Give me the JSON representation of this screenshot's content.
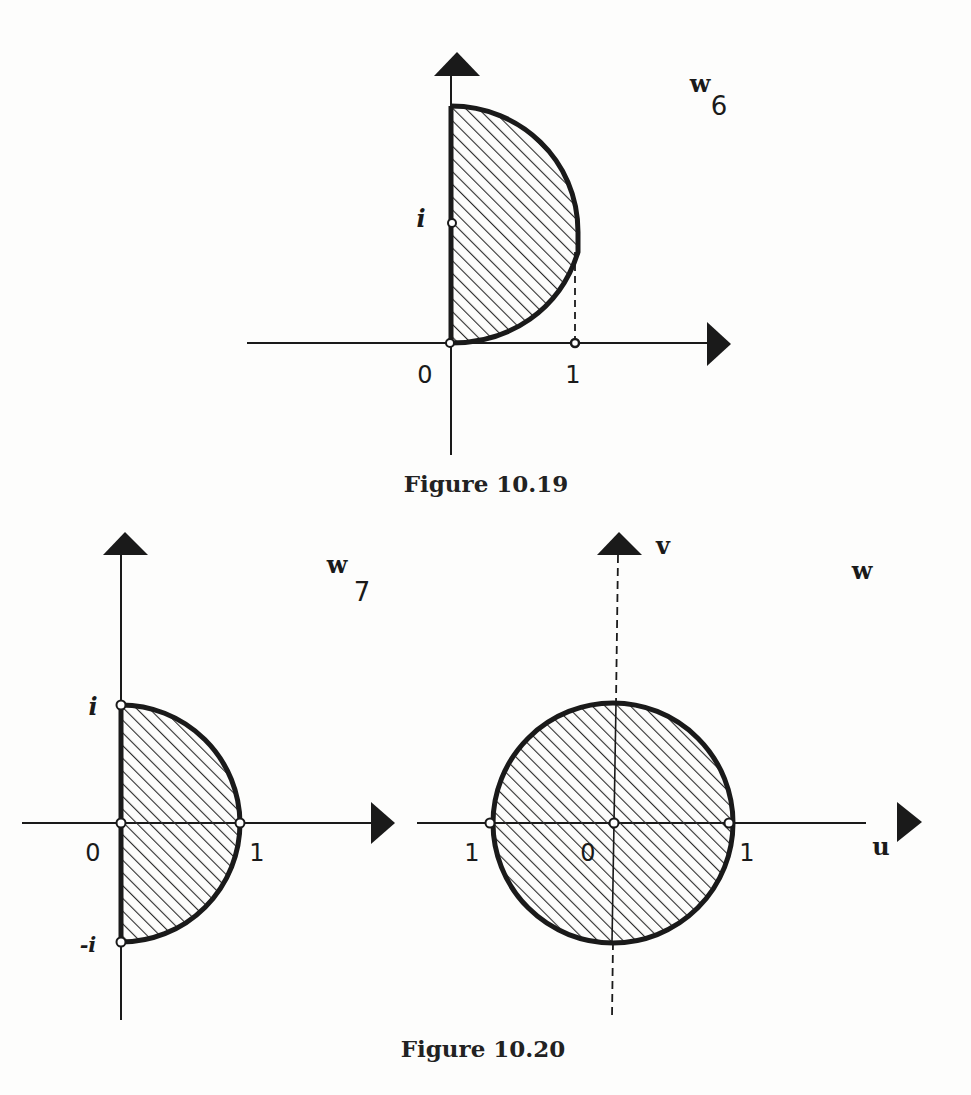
{
  "figures": [
    {
      "id": "fig-10-19",
      "caption": "Figure 10.19",
      "plane_label": "w",
      "plane_subscript": "6",
      "points": {
        "origin": "0",
        "one": "1",
        "i": "i"
      },
      "region": "half-disk bounded by segment [0, i·2] on imaginary axis and arc to the right, touching Re = 1"
    },
    {
      "id": "fig-10-20-left",
      "caption": "Figure 10.20",
      "plane_label": "w",
      "plane_subscript": "7",
      "points": {
        "origin": "0",
        "one": "1",
        "i": "i",
        "minus_i": "-i"
      },
      "region": "right half of unit disk"
    },
    {
      "id": "fig-10-20-right",
      "plane_label": "w",
      "axes": {
        "horizontal": "u",
        "vertical": "v"
      },
      "points": {
        "origin": "0",
        "one_right": "1",
        "one_left": "1"
      },
      "region": "unit disk"
    }
  ],
  "captions": {
    "fig_10_19": "Figure 10.19",
    "fig_10_20": "Figure 10.20"
  },
  "colors": {
    "ink": "#1a1a1a",
    "paper": "#fdfdfc",
    "hatch": "#2a2a2a"
  }
}
